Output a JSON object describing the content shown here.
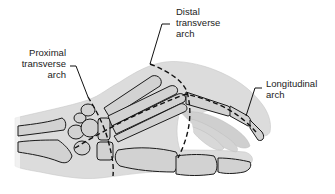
{
  "figure": {
    "colors": {
      "skin_fill": "#d9d9d9",
      "skin_fill_light": "#e6e6e6",
      "bone_fill": "#d2d2d2",
      "outline": "#1a1a1a",
      "background": "#ffffff"
    }
  },
  "labels": {
    "proximal": {
      "line1": "Proximal",
      "line2": "transverse",
      "line3": "arch"
    },
    "distal": {
      "line1": "Distal",
      "line2": "transverse",
      "line3": "arch"
    },
    "longitudinal": {
      "line1": "Longitudinal",
      "line2": "arch"
    }
  }
}
